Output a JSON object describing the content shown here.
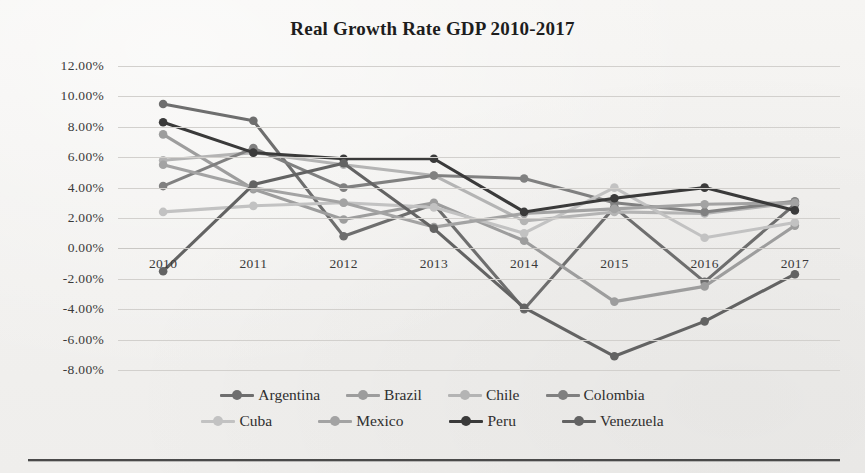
{
  "chart_data": {
    "type": "line",
    "title": "Real Growth Rate GDP 2010-2017",
    "xlabel": "",
    "ylabel": "",
    "categories": [
      "2010",
      "2011",
      "2012",
      "2013",
      "2014",
      "2015",
      "2016",
      "2017"
    ],
    "ylim": [
      -8,
      12
    ],
    "ytick_step": 2,
    "ytick_labels": [
      "12.00%",
      "10.00%",
      "8.00%",
      "6.00%",
      "4.00%",
      "2.00%",
      "0.00%",
      "-2.00%",
      "-4.00%",
      "-6.00%",
      "-8.00%"
    ],
    "ytick_values": [
      12,
      10,
      8,
      6,
      4,
      2,
      0,
      -2,
      -4,
      -6,
      -8
    ],
    "grid": true,
    "legend_position": "bottom",
    "value_suffix": "%",
    "series": [
      {
        "name": "Argentina",
        "color": "#6e6e6e",
        "values": [
          9.5,
          8.4,
          0.8,
          2.9,
          -4.0,
          2.7,
          -2.2,
          2.9
        ]
      },
      {
        "name": "Brazil",
        "color": "#9d9d9d",
        "values": [
          7.5,
          3.9,
          1.9,
          3.0,
          0.5,
          -3.5,
          -2.5,
          1.5
        ]
      },
      {
        "name": "Chile",
        "color": "#b4b4b4",
        "values": [
          5.8,
          6.3,
          5.5,
          4.8,
          1.8,
          2.4,
          2.3,
          3.0
        ]
      },
      {
        "name": "Colombia",
        "color": "#808080",
        "values": [
          4.1,
          6.6,
          4.0,
          4.8,
          4.6,
          3.0,
          2.4,
          3.1
        ]
      },
      {
        "name": "Cuba",
        "color": "#c2c2c2",
        "values": [
          2.4,
          2.8,
          3.0,
          2.7,
          1.0,
          4.0,
          0.7,
          1.7
        ]
      },
      {
        "name": "Mexico",
        "color": "#a3a3a3",
        "values": [
          5.5,
          4.0,
          3.0,
          1.4,
          2.3,
          2.6,
          2.9,
          3.0
        ]
      },
      {
        "name": "Peru",
        "color": "#3a3a3a",
        "values": [
          8.3,
          6.3,
          5.9,
          5.9,
          2.4,
          3.3,
          4.0,
          2.5
        ]
      },
      {
        "name": "Venezuela",
        "color": "#636363",
        "values": [
          -1.5,
          4.2,
          5.6,
          1.3,
          -3.9,
          -7.1,
          -4.8,
          -1.7
        ]
      }
    ]
  },
  "legend": {
    "row1": [
      "Argentina",
      "Brazil",
      "Chile",
      "Colombia"
    ],
    "row2": [
      "Cuba",
      "Mexico",
      "Peru",
      "Venezuela"
    ]
  }
}
